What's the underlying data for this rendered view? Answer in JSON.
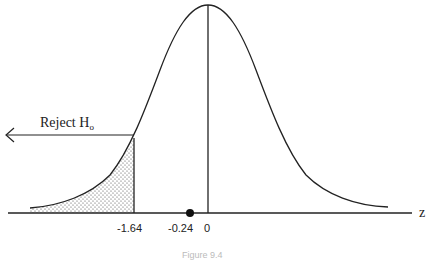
{
  "figure": {
    "reject_label": "Reject H",
    "reject_subscript": "o",
    "axis_label": "z",
    "ticks": [
      {
        "label": "-1.64",
        "value": -1.64
      },
      {
        "label": "-0.24",
        "value": -0.24
      },
      {
        "label": "0",
        "value": 0
      }
    ],
    "caption": "Figure 9.4",
    "critical_value": -1.64,
    "test_statistic": -0.24,
    "shaded_region": "left tail, z < -1.64",
    "colors": {
      "line": "#222222",
      "shade_dots": "#444444",
      "background": "#ffffff"
    }
  }
}
